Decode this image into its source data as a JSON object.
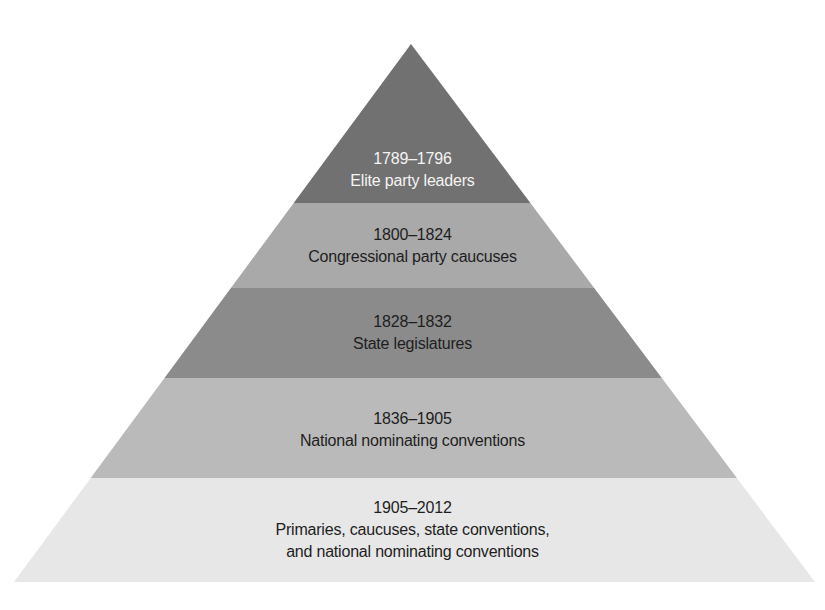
{
  "diagram": {
    "type": "pyramid",
    "title": "",
    "geometry": {
      "apex": [
        411,
        44
      ],
      "base_left": [
        14,
        582
      ],
      "base_right": [
        815,
        582
      ]
    },
    "tiers": [
      {
        "years": "1789–1796",
        "description": "Elite party leaders",
        "fill": "#717171",
        "text_color": "#f4f4f4",
        "y_top": 44,
        "y_bottom": 203,
        "label_top": 148
      },
      {
        "years": "1800–1824",
        "description": "Congressional party caucuses",
        "fill": "#a9a9a9",
        "text_color": "#1e1e1e",
        "y_top": 203,
        "y_bottom": 288,
        "label_top": 224
      },
      {
        "years": "1828–1832",
        "description": "State legislatures",
        "fill": "#8b8b8b",
        "text_color": "#1e1e1e",
        "y_top": 288,
        "y_bottom": 378,
        "label_top": 311
      },
      {
        "years": "1836–1905",
        "description": "National nominating conventions",
        "fill": "#bababa",
        "text_color": "#1e1e1e",
        "y_top": 378,
        "y_bottom": 478,
        "label_top": 408
      },
      {
        "years": "1905–2012",
        "description": "Primaries, caucuses, state conventions,\nand national nominating conventions",
        "description_lines": [
          "Primaries, caucuses, state conventions,",
          "and national nominating conventions"
        ],
        "fill": "#e7e7e7",
        "text_color": "#1e1e1e",
        "y_top": 478,
        "y_bottom": 582,
        "label_top": 497
      }
    ]
  }
}
